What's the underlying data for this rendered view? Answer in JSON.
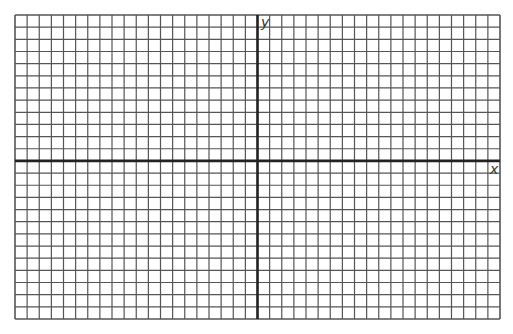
{
  "grid": {
    "left": 15,
    "top": 15,
    "right": 500,
    "bottom": 319,
    "columns": 40,
    "rows": 25,
    "origin_col": 20,
    "origin_row": 12,
    "grid_color": "#555555",
    "axis_color": "#222222"
  },
  "labels": {
    "x_axis": "x",
    "y_axis": "y"
  }
}
